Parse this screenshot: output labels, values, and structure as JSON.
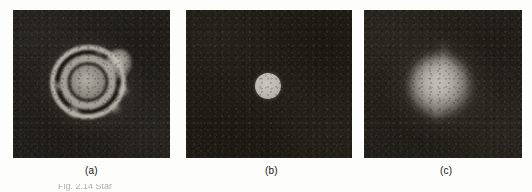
{
  "figure": {
    "kind": "scanned-plate",
    "panel_count": 3,
    "caption_partial": "Fig. 2.14 Star",
    "panels": [
      {
        "id": "a",
        "label": "(a)",
        "description": "Defocused star image showing concentric diffraction rings with bright lobes",
        "background_color": "#2a2721",
        "feature_color": "#ded9cf"
      },
      {
        "id": "b",
        "label": "(b)",
        "description": "Sharply focused star image, small bright circular disc",
        "background_color": "#262319",
        "feature_color": "#e8e6dd"
      },
      {
        "id": "c",
        "label": "(c)",
        "description": "Blurred star image, large diffuse bright blob",
        "background_color": "#2b2820",
        "feature_color": "#ecebe2"
      }
    ]
  }
}
